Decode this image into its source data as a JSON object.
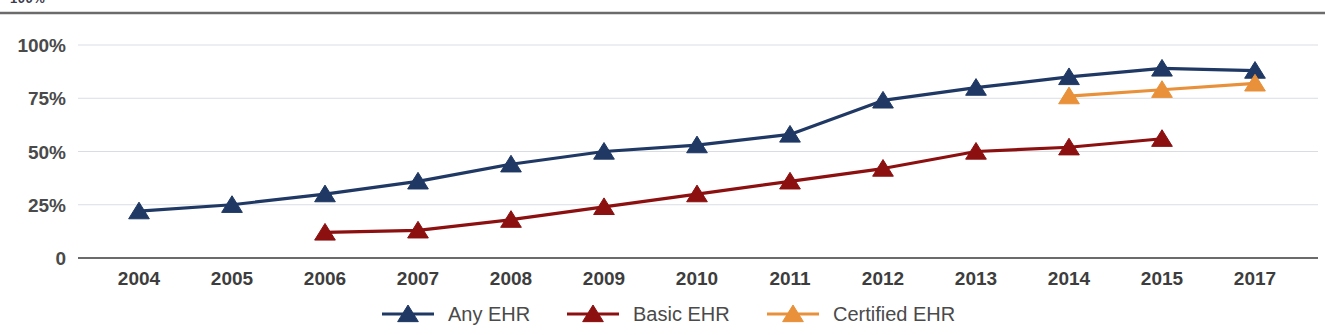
{
  "chart_data": {
    "type": "line",
    "title": "",
    "subtitle": "",
    "xlabel": "",
    "ylabel": "",
    "categories": [
      "2004",
      "2005",
      "2006",
      "2007",
      "2008",
      "2009",
      "2010",
      "2011",
      "2012",
      "2013",
      "2014",
      "2015",
      "2017"
    ],
    "ylim": [
      0,
      100
    ],
    "ytick_labels": [
      "100%",
      "75%",
      "50%",
      "25%",
      "0"
    ],
    "ytick_values": [
      100,
      75,
      50,
      25,
      0
    ],
    "grid": "horizontal",
    "legend_position": "bottom-center",
    "series": [
      {
        "name": "Any EHR",
        "color": "#1F3864",
        "marker": "triangle",
        "values": [
          22,
          25,
          30,
          36,
          44,
          50,
          53,
          58,
          74,
          80,
          85,
          89,
          88
        ]
      },
      {
        "name": "Basic EHR",
        "color": "#8C1010",
        "marker": "triangle",
        "values": [
          null,
          null,
          12,
          13,
          18,
          24,
          30,
          36,
          42,
          50,
          52,
          56,
          null
        ]
      },
      {
        "name": "Certified EHR",
        "color": "#E8913A",
        "marker": "triangle",
        "values": [
          null,
          null,
          null,
          null,
          null,
          null,
          null,
          null,
          null,
          null,
          76,
          79,
          82
        ]
      }
    ]
  },
  "legend": {
    "items": [
      {
        "label": "Any EHR",
        "color": "#1F3864"
      },
      {
        "label": "Basic EHR",
        "color": "#8C1010"
      },
      {
        "label": "Certified EHR",
        "color": "#E8913A"
      }
    ]
  },
  "clipped_top_text": "100%"
}
